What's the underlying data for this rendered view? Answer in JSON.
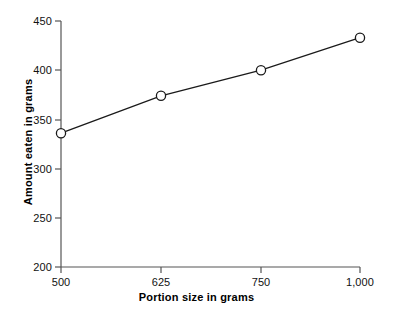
{
  "chart_data": {
    "type": "line",
    "title": "",
    "xlabel": "Portion size in grams",
    "ylabel": "Amount eaten in grams",
    "categories": [
      "500",
      "625",
      "750",
      "1,000"
    ],
    "values": [
      336,
      374,
      400,
      433
    ],
    "series": [
      {
        "name": "Amount eaten",
        "values": [
          336,
          374,
          400,
          433
        ]
      }
    ],
    "ylim": [
      200,
      450
    ],
    "yticks": [
      200,
      250,
      300,
      350,
      400,
      450
    ],
    "ytick_labels": [
      "200",
      "250",
      "300",
      "350",
      "400",
      "450"
    ],
    "xtick_labels": [
      "500",
      "625",
      "750",
      "1,000"
    ],
    "grid": false,
    "legend": false,
    "legend_position": "none",
    "marker": "open-circle",
    "line_color": "#1a1a1a",
    "marker_fill": "#ffffff",
    "marker_stroke": "#1a1a1a",
    "axis_color": "#555555",
    "background": "#ffffff"
  }
}
